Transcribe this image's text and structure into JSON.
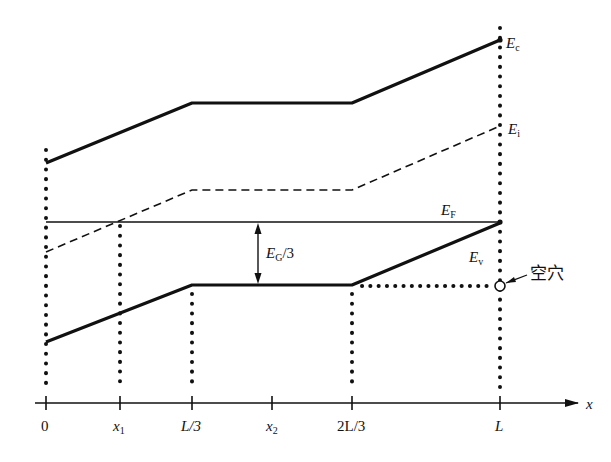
{
  "diagram": {
    "type": "energy-band-diagram",
    "axis": {
      "label": "x",
      "ticks": [
        {
          "label": "0",
          "x": 46
        },
        {
          "label": "x1",
          "base": "x",
          "sub": "1",
          "x": 120
        },
        {
          "label": "L/3",
          "x": 192
        },
        {
          "label": "x2",
          "base": "x",
          "sub": "2",
          "x": 272
        },
        {
          "label": "2L/3",
          "x": 352
        },
        {
          "label": "L",
          "x": 500
        }
      ]
    },
    "bands": {
      "Ec": {
        "base": "E",
        "sub": "c",
        "style": "solid-thick",
        "points": [
          [
            46,
            163
          ],
          [
            192,
            103
          ],
          [
            352,
            103
          ],
          [
            500,
            40
          ]
        ]
      },
      "Ei": {
        "base": "E",
        "sub": "i",
        "style": "dashed",
        "points": [
          [
            46,
            252
          ],
          [
            192,
            190
          ],
          [
            352,
            190
          ],
          [
            500,
            126
          ]
        ]
      },
      "EF": {
        "base": "E",
        "sub": "F",
        "style": "solid-thin",
        "points": [
          [
            46,
            222
          ],
          [
            500,
            222
          ]
        ]
      },
      "Ev": {
        "base": "E",
        "sub": "v",
        "style": "solid-thick",
        "points": [
          [
            46,
            342
          ],
          [
            192,
            285
          ],
          [
            352,
            285
          ],
          [
            500,
            223
          ]
        ]
      }
    },
    "annotations": {
      "gap_arrow": {
        "base": "E",
        "sub": "G",
        "suffix": "/3",
        "label": "EG/3"
      },
      "hole": {
        "label": "空穴",
        "meaning": "hole"
      }
    }
  }
}
